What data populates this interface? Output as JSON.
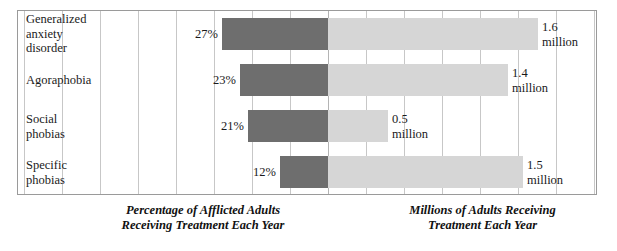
{
  "chart_data": {
    "type": "bar",
    "title": "",
    "orientation": "horizontal-diverging",
    "categories": [
      "Generalized anxiety disorder",
      "Agoraphobia",
      "Social phobias",
      "Specific phobias"
    ],
    "series": [
      {
        "name": "Percentage of Afflicted Adults Receiving Treatment Each Year",
        "unit": "%",
        "direction": "left",
        "color": "#6e6e6e",
        "values": [
          27,
          23,
          21,
          12
        ],
        "labels": [
          "27%",
          "23%",
          "21%",
          "12%"
        ]
      },
      {
        "name": "Millions of Adults Receiving Treatment Each Year",
        "unit": "million",
        "direction": "right",
        "color": "#d6d6d6",
        "values": [
          1.6,
          1.4,
          0.5,
          1.5
        ],
        "labels": [
          "1.6\nmillion",
          "1.4\nmillion",
          "0.5\nmillion",
          "1.5\nmillion"
        ]
      }
    ],
    "axis_left_label": "Percentage of Afflicted Adults\nReceiving Treatment Each Year",
    "axis_right_label": "Millions of Adults Receiving\nTreatment Each Year",
    "grid": true,
    "gridline_count": 15,
    "legend": "none",
    "tick_labels": []
  },
  "rows": [
    {
      "category": "Generalized\nanxiety\ndisorder",
      "percent_label": "27%",
      "million_label": "1.6\nmillion",
      "left_px": 106,
      "right_px": 210
    },
    {
      "category": "Agoraphobia",
      "percent_label": "23%",
      "million_label": "1.4\nmillion",
      "left_px": 88,
      "right_px": 180
    },
    {
      "category": "Social\nphobias",
      "percent_label": "21%",
      "million_label": "0.5\nmillion",
      "left_px": 80,
      "right_px": 60
    },
    {
      "category": "Specific\nphobias",
      "percent_label": "12%",
      "million_label": "1.5\nmillion",
      "left_px": 48,
      "right_px": 195
    }
  ],
  "captions": {
    "left": "Percentage of Afflicted Adults\nReceiving Treatment Each Year",
    "right": "Millions of Adults Receiving\nTreatment Each Year"
  },
  "colors": {
    "bar_left": "#6e6e6e",
    "bar_right": "#d6d6d6",
    "gridline": "#c7c7c7",
    "border": "#9a9a9a",
    "text": "#1a1a1a",
    "background": "#ffffff"
  }
}
